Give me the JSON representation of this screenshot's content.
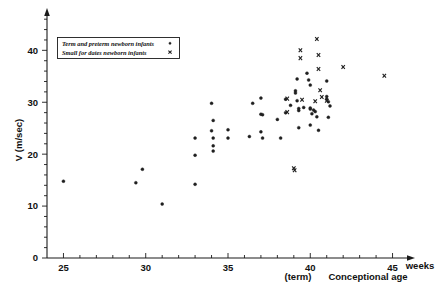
{
  "chart_data": {
    "type": "scatter",
    "title": "",
    "xlabel": "Conceptional age",
    "xunit": "weeks",
    "ylabel": "V (m/sec)",
    "xlim": [
      24,
      46
    ],
    "ylim": [
      0,
      47
    ],
    "xticks": [
      25,
      30,
      35,
      40,
      45
    ],
    "yticks": [
      0,
      10,
      20,
      30,
      40
    ],
    "x_minor_step": 1,
    "y_minor_step": 2,
    "grid": false,
    "annotations": [
      {
        "text": "(term)",
        "x": 40,
        "axis": "x-below"
      }
    ],
    "legend_position": "top-left",
    "series": [
      {
        "name": "Term and preterm newborn infants",
        "marker": "circle",
        "points": [
          [
            25.0,
            14.8
          ],
          [
            29.4,
            14.5
          ],
          [
            29.8,
            17.1
          ],
          [
            31.0,
            10.4
          ],
          [
            33.0,
            23.1
          ],
          [
            33.0,
            19.8
          ],
          [
            33.0,
            14.2
          ],
          [
            34.0,
            29.8
          ],
          [
            34.1,
            26.5
          ],
          [
            34.0,
            24.5
          ],
          [
            34.1,
            23.1
          ],
          [
            34.1,
            21.6
          ],
          [
            34.1,
            20.6
          ],
          [
            35.0,
            24.7
          ],
          [
            35.0,
            23.1
          ],
          [
            36.3,
            23.4
          ],
          [
            36.5,
            29.8
          ],
          [
            37.0,
            30.8
          ],
          [
            37.0,
            27.7
          ],
          [
            37.1,
            27.6
          ],
          [
            37.0,
            24.3
          ],
          [
            37.1,
            23.1
          ],
          [
            38.0,
            26.7
          ],
          [
            38.2,
            23.1
          ],
          [
            38.5,
            30.6
          ],
          [
            38.5,
            28.0
          ],
          [
            38.8,
            29.4
          ],
          [
            39.1,
            32.2
          ],
          [
            39.1,
            31.8
          ],
          [
            39.2,
            30.3
          ],
          [
            39.2,
            34.5
          ],
          [
            39.3,
            28.8
          ],
          [
            39.3,
            28.4
          ],
          [
            39.3,
            25.1
          ],
          [
            39.6,
            29.0
          ],
          [
            39.8,
            35.6
          ],
          [
            39.9,
            34.3
          ],
          [
            40.0,
            33.3
          ],
          [
            40.0,
            28.9
          ],
          [
            40.0,
            28.7
          ],
          [
            40.0,
            25.6
          ],
          [
            40.1,
            27.8
          ],
          [
            40.2,
            28.5
          ],
          [
            40.3,
            28.2
          ],
          [
            40.4,
            27.2
          ],
          [
            40.5,
            24.6
          ],
          [
            41.0,
            34.1
          ],
          [
            41.0,
            31.1
          ],
          [
            41.0,
            30.6
          ],
          [
            41.1,
            30.1
          ],
          [
            41.2,
            29.3
          ],
          [
            41.1,
            27.1
          ]
        ]
      },
      {
        "name": "Small for dates newborn infants",
        "marker": "x",
        "points": [
          [
            38.6,
            30.7
          ],
          [
            38.6,
            28.1
          ],
          [
            39.0,
            17.3
          ],
          [
            39.05,
            16.9
          ],
          [
            39.4,
            40.0
          ],
          [
            39.4,
            38.5
          ],
          [
            39.5,
            30.5
          ],
          [
            40.4,
            42.2
          ],
          [
            40.5,
            39.1
          ],
          [
            40.5,
            36.4
          ],
          [
            40.6,
            32.3
          ],
          [
            40.7,
            31.0
          ],
          [
            40.3,
            30.2
          ],
          [
            41.0,
            30.3
          ],
          [
            42.0,
            36.8
          ],
          [
            44.5,
            35.1
          ]
        ]
      }
    ]
  },
  "legend": {
    "entries": [
      {
        "label": "Term and preterm newborn infants",
        "marker": "circle"
      },
      {
        "label": "Small for dates newborn infants",
        "marker": "x"
      }
    ]
  },
  "axes": {
    "y_axis_label": "V (m/sec)",
    "x_axis_label": "Conceptional age",
    "x_axis_unit": "weeks",
    "term_marker": "(term)",
    "x_tick_labels": [
      "25",
      "30",
      "35",
      "40",
      "45"
    ],
    "y_tick_labels": [
      "0",
      "10",
      "20",
      "30",
      "40"
    ]
  },
  "colors": {
    "marker": "#1f1f1f",
    "axis": "#1a1a1a",
    "background": "#ffffff"
  }
}
